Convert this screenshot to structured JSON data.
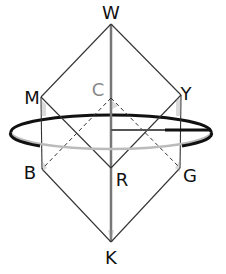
{
  "diagram": {
    "type": "rotation-axis-cube-diagram",
    "colors": {
      "edge": "#333333",
      "axis": "#777777",
      "hidden_label": "#888888",
      "ellipse_front": "#111111",
      "ellipse_back": "#bbbbbb",
      "background": "#ffffff"
    },
    "vertices": {
      "W": {
        "label": "W",
        "x": 111,
        "y": 24,
        "label_x": 111,
        "label_y": 19,
        "hidden": false
      },
      "M": {
        "label": "M",
        "x": 41,
        "y": 97,
        "label_x": 32,
        "label_y": 104,
        "hidden": false
      },
      "Y": {
        "label": "Y",
        "x": 181,
        "y": 95,
        "label_x": 186,
        "label_y": 100,
        "hidden": false
      },
      "C": {
        "label": "C",
        "x": 111,
        "y": 98,
        "label_x": 98,
        "label_y": 96,
        "hidden": true
      },
      "B": {
        "label": "B",
        "x": 42,
        "y": 169,
        "label_x": 30,
        "label_y": 179,
        "hidden": false
      },
      "G": {
        "label": "G",
        "x": 180,
        "y": 168,
        "label_x": 190,
        "label_y": 182,
        "hidden": false
      },
      "R": {
        "label": "R",
        "x": 111,
        "y": 168,
        "label_x": 122,
        "label_y": 186,
        "hidden": false
      },
      "K": {
        "label": "K",
        "x": 111,
        "y": 242,
        "label_x": 111,
        "label_y": 264,
        "hidden": false
      }
    },
    "edges_solid": [
      [
        "W",
        "M"
      ],
      [
        "W",
        "Y"
      ],
      [
        "M",
        "R"
      ],
      [
        "Y",
        "R"
      ],
      [
        "M",
        "B"
      ],
      [
        "Y",
        "G"
      ],
      [
        "B",
        "K"
      ],
      [
        "G",
        "K"
      ],
      [
        "R",
        "K"
      ],
      [
        "W",
        "R"
      ]
    ],
    "edges_dashed": [
      [
        "C",
        "B"
      ],
      [
        "C",
        "G"
      ]
    ],
    "rotation_ring": {
      "cx": 111,
      "cy": 132,
      "rx": 100,
      "ry": 17
    },
    "radius_marker": {
      "x1": 111,
      "y1": 130,
      "x2": 211,
      "y2": 130,
      "thick_from": 165
    }
  }
}
